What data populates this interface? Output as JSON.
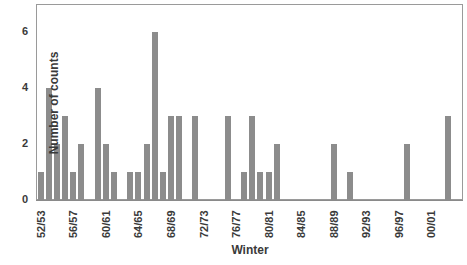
{
  "chart_data": {
    "type": "bar",
    "title": "",
    "xlabel": "Winter",
    "ylabel": "Number of counts",
    "ylim": [
      0,
      7
    ],
    "yticks": [
      0,
      2,
      4,
      6
    ],
    "xtick_labels": [
      "52/53",
      "56/57",
      "60/61",
      "64/65",
      "68/69",
      "72/73",
      "76/77",
      "80/81",
      "84/85",
      "88/89",
      "92/93",
      "96/97",
      "00/01"
    ],
    "grid": false,
    "legend": null,
    "categories": [
      "52/53",
      "53/54",
      "54/55",
      "55/56",
      "56/57",
      "57/58",
      "58/59",
      "59/60",
      "60/61",
      "61/62",
      "62/63",
      "63/64",
      "64/65",
      "65/66",
      "66/67",
      "67/68",
      "68/69",
      "69/70",
      "70/71",
      "71/72",
      "72/73",
      "73/74",
      "74/75",
      "75/76",
      "76/77",
      "77/78",
      "78/79",
      "79/80",
      "80/81",
      "81/82",
      "82/83",
      "83/84",
      "84/85",
      "85/86",
      "86/87",
      "87/88",
      "88/89",
      "89/90",
      "90/91",
      "91/92",
      "92/93",
      "93/94",
      "94/95",
      "95/96",
      "96/97",
      "97/98",
      "98/99",
      "99/00",
      "00/01",
      "01/02",
      "02/03"
    ],
    "values": [
      1,
      4,
      2,
      3,
      1,
      2,
      0,
      4,
      2,
      1,
      0,
      1,
      1,
      2,
      6,
      1,
      3,
      3,
      0,
      3,
      0,
      0,
      0,
      3,
      0,
      1,
      3,
      1,
      1,
      2,
      0,
      0,
      0,
      0,
      0,
      0,
      2,
      0,
      1,
      0,
      0,
      0,
      0,
      0,
      0,
      2,
      0,
      0,
      0,
      0,
      3
    ],
    "bar_color": "#8c8c8c"
  },
  "labels": {
    "xlabel": "Winter",
    "ylabel": "Number of counts"
  }
}
